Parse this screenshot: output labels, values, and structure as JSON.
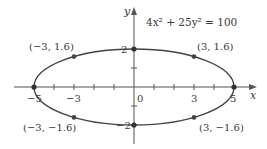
{
  "diagram": {
    "equation": "4x² + 25y² = 100",
    "axes": {
      "x_label": "x",
      "y_label": "y",
      "x_ticks": [
        "−5",
        "−3",
        "0",
        "3",
        "5"
      ],
      "y_ticks": [
        "2",
        "−2"
      ]
    },
    "points": [
      {
        "label": "(−3, 1.6)",
        "x": -3,
        "y": 1.6
      },
      {
        "label": "(3, 1.6)",
        "x": 3,
        "y": 1.6
      },
      {
        "label": "(−3, −1.6)",
        "x": -3,
        "y": -1.6
      },
      {
        "label": "(3, −1.6)",
        "x": 3,
        "y": -1.6
      }
    ],
    "vertices": [
      {
        "x": -5,
        "y": 0
      },
      {
        "x": 5,
        "y": 0
      },
      {
        "x": 0,
        "y": 2
      },
      {
        "x": 0,
        "y": -2
      }
    ],
    "colors": {
      "curve": "#444444",
      "axis": "#555555",
      "text": "#3a3a3a"
    }
  }
}
